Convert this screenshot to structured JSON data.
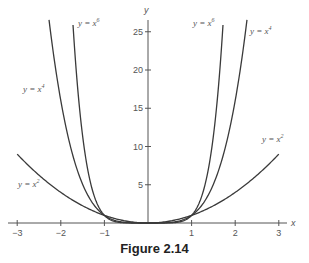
{
  "chart_data": {
    "type": "line",
    "title": "Figure 2.14",
    "xlabel": "x",
    "ylabel": "y",
    "xlim": [
      -3,
      3
    ],
    "ylim": [
      0,
      26.5
    ],
    "x_ticks": [
      -3,
      -2,
      -1,
      1,
      2,
      3
    ],
    "y_ticks": [
      5,
      10,
      15,
      20,
      25
    ],
    "grid": false,
    "legend": "inline curve labels",
    "series": [
      {
        "name": "y = x^2",
        "function": "x^2",
        "x_range": [
          -3,
          3
        ]
      },
      {
        "name": "y = x^4",
        "function": "x^4",
        "x_range": [
          -2.27,
          2.27
        ]
      },
      {
        "name": "y = x^6",
        "function": "x^6",
        "x_range": [
          -1.72,
          1.72
        ]
      }
    ],
    "annotations": [
      {
        "text": "y = x^6",
        "position": "upper-left near curve top"
      },
      {
        "text": "y = x^4",
        "position": "left, mid height"
      },
      {
        "text": "y = x^2",
        "position": "left, lower"
      },
      {
        "text": "y = x^6",
        "position": "upper-right near curve top"
      },
      {
        "text": "y = x^4",
        "position": "upper-right"
      },
      {
        "text": "y = x^2",
        "position": "right, near x=3"
      }
    ]
  },
  "caption": "Figure 2.14",
  "axis_labels": {
    "x": "x",
    "y": "y"
  },
  "tick_labels": {
    "x": [
      "−3",
      "−2",
      "−1",
      "1",
      "2",
      "3"
    ],
    "y": [
      "5",
      "10",
      "15",
      "20",
      "25"
    ]
  },
  "curve_labels": {
    "x6_left": "y = x",
    "x6_left_exp": "6",
    "x4_left": "y = x",
    "x4_left_exp": "4",
    "x2_left": "y = x",
    "x2_left_exp": "2",
    "x6_right": "y = x",
    "x6_right_exp": "6",
    "x4_right": "y = x",
    "x4_right_exp": "4",
    "x2_right": "y = x",
    "x2_right_exp": "2"
  },
  "colors": {
    "curve": "#3a3a3a",
    "axis": "#555555",
    "text": "#555555"
  }
}
